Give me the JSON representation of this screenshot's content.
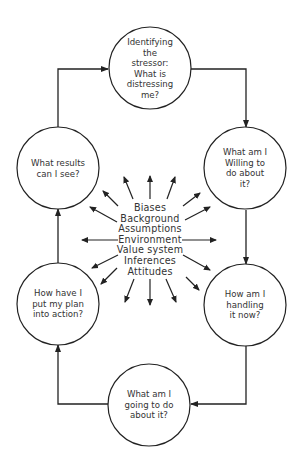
{
  "diagram": {
    "type": "cycle",
    "nodes": [
      {
        "id": "identify",
        "label": "Identifying\nthe\nstressor:\nWhat is\ndistressing\nme?"
      },
      {
        "id": "willing",
        "label": "What am I\nWilling to\ndo about\nit?"
      },
      {
        "id": "handling",
        "label": "How am I\nhandling\nit now?"
      },
      {
        "id": "going",
        "label": "What am I\ngoing to do\nabout it?"
      },
      {
        "id": "action",
        "label": "How have I\nput my plan\ninto action?"
      },
      {
        "id": "results",
        "label": "What results\ncan I see?"
      }
    ],
    "edges": [
      {
        "from": "identify",
        "to": "willing"
      },
      {
        "from": "willing",
        "to": "handling"
      },
      {
        "from": "handling",
        "to": "going"
      },
      {
        "from": "going",
        "to": "action"
      },
      {
        "from": "action",
        "to": "results"
      },
      {
        "from": "results",
        "to": "identify"
      }
    ],
    "center_factors": [
      "Biases",
      "Background",
      "Assumptions",
      "Environment",
      "Value system",
      "Inferences",
      "Attitudes"
    ],
    "colors": {
      "line": "#222222",
      "text": "#333333",
      "background": "#ffffff"
    }
  }
}
